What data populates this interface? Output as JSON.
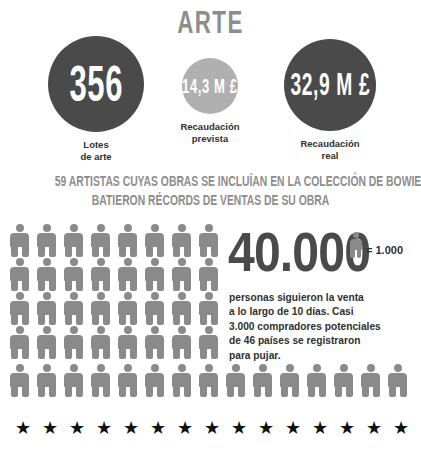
{
  "title": "ARTE",
  "stats": [
    {
      "id": "lotes",
      "value": "356",
      "caption": "Lotes\nde arte",
      "circle_color": "#4a4a4a"
    },
    {
      "id": "prevista",
      "value": "14,3 M £",
      "caption": "Recaudación\nprevista",
      "circle_color": "#b0b0b0"
    },
    {
      "id": "real",
      "value": "32,9 M £",
      "caption": "Recaudación\nreal",
      "circle_color": "#4a4a4a"
    }
  ],
  "headline": {
    "line1": "59 ARTISTAS CUYAS OBRAS SE INCLUÍAN EN LA COLECCIÓN DE BOWIE",
    "line2": "BATIERON RÉCORDS DE VENTAS DE SU OBRA"
  },
  "big_number": "40.000",
  "legend": {
    "label": "= 1.000",
    "icon": "person-icon"
  },
  "body_text": {
    "line1": "personas siguieron la venta",
    "line2": "a lo largo de 10 días. Casi",
    "line3": "3.000 compradores potenciales",
    "line4": "de 46 países se registraron",
    "line5": "para pujar."
  },
  "chart_data": {
    "type": "pictogram",
    "unit_value": 1000,
    "unit_label": "= 1.000",
    "total": 40000,
    "icon": "person",
    "icon_color": "#8a8a8a",
    "rows": [
      {
        "count": 8,
        "width": "left"
      },
      {
        "count": 8,
        "width": "left"
      },
      {
        "count": 8,
        "width": "left"
      },
      {
        "count": 8,
        "width": "left"
      },
      {
        "count": 15,
        "width": "full"
      }
    ],
    "displayed_icons": 47,
    "stars": {
      "count": 15,
      "color": "#111111"
    }
  },
  "colors": {
    "dark": "#4a4a4a",
    "mid_gray": "#8a8a8a",
    "light_gray": "#b0b0b0",
    "headline_gray": "#8d8d8d",
    "text": "#2f2f2f",
    "background": "#ffffff"
  }
}
